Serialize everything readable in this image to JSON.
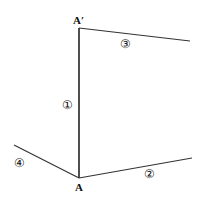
{
  "diagram": {
    "points": {
      "A": {
        "label": "A",
        "x": 79,
        "y": 178
      },
      "A_prime": {
        "label": "A′",
        "x": 79,
        "y": 28
      }
    },
    "lines": [
      {
        "id": "1",
        "label": "①",
        "from": [
          79,
          28
        ],
        "to": [
          79,
          178
        ]
      },
      {
        "id": "2",
        "label": "②",
        "from": [
          79,
          178
        ],
        "to": [
          192,
          158
        ]
      },
      {
        "id": "3",
        "label": "③",
        "from": [
          79,
          28
        ],
        "to": [
          190,
          41
        ]
      },
      {
        "id": "4",
        "label": "④",
        "from": [
          14,
          145
        ],
        "to": [
          79,
          178
        ]
      }
    ],
    "line_color": "#222222"
  }
}
